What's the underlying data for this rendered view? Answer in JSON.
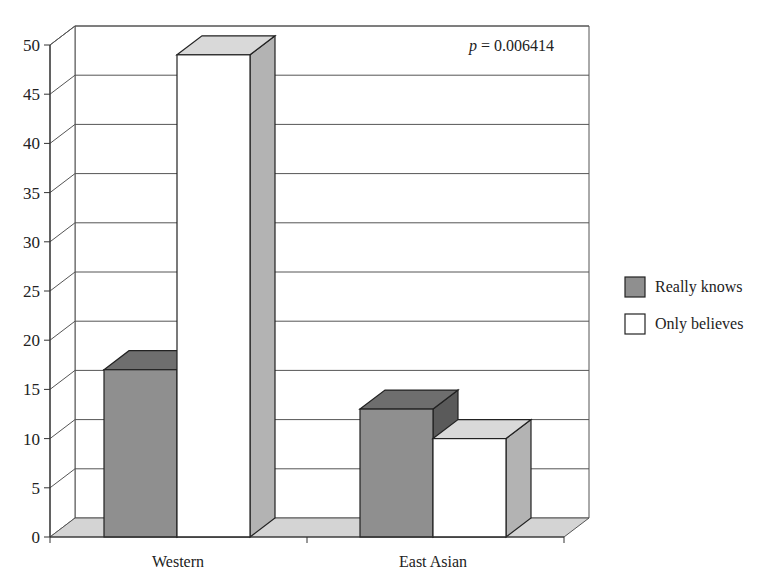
{
  "chart_data": {
    "type": "bar",
    "style": "3d-clustered-column",
    "title": "",
    "xlabel": "",
    "ylabel": "",
    "categories": [
      "Western",
      "East Asian"
    ],
    "series": [
      {
        "name": "Really knows",
        "values": [
          17,
          13
        ],
        "color": "#8f8f8f",
        "top_color": "#6e6e6e",
        "side_color": "#5a5a5a"
      },
      {
        "name": "Only believes",
        "values": [
          49,
          10
        ],
        "color": "#ffffff",
        "top_color": "#d9d9d9",
        "side_color": "#b3b3b3"
      }
    ],
    "ylim": [
      0,
      50
    ],
    "yticks": [
      0,
      5,
      10,
      15,
      20,
      25,
      30,
      35,
      40,
      45,
      50
    ],
    "grid": true,
    "legend_position": "right",
    "annotations": [
      {
        "text_italic": "p",
        "text": " = 0.006414",
        "position": "top-right"
      }
    ]
  }
}
